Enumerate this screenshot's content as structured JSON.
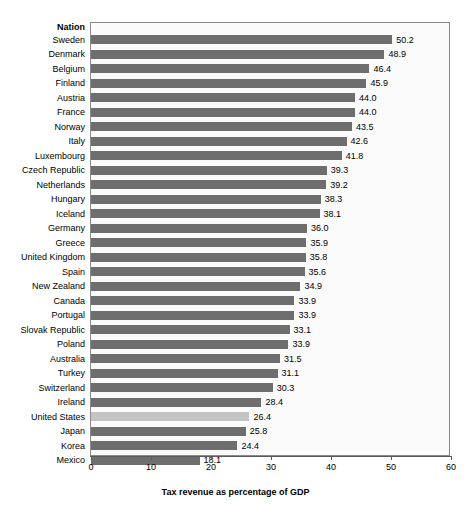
{
  "chart_data": {
    "type": "bar",
    "orientation": "horizontal",
    "title": "",
    "category_header": "Nation",
    "xlabel": "Tax revenue as percentage of GDP",
    "ylabel": "",
    "xlim": [
      0,
      60
    ],
    "xticks": [
      0,
      10,
      20,
      30,
      40,
      50,
      60
    ],
    "grid": false,
    "legend": null,
    "categories": [
      "Sweden",
      "Denmark",
      "Belgium",
      "Finland",
      "Austria",
      "France",
      "Norway",
      "Italy",
      "Luxembourg",
      "Czech Republic",
      "Netherlands",
      "Hungary",
      "Iceland",
      "Germany",
      "Greece",
      "United Kingdom",
      "Spain",
      "New Zealand",
      "Canada",
      "Portugal",
      "Slovak Republic",
      "Poland",
      "Australia",
      "Turkey",
      "Switzerland",
      "Ireland",
      "United States",
      "Japan",
      "Korea",
      "Mexico"
    ],
    "values": [
      50.2,
      48.9,
      46.4,
      45.9,
      44.0,
      44.0,
      43.5,
      42.6,
      41.8,
      39.3,
      39.2,
      38.3,
      38.1,
      36.0,
      35.9,
      35.8,
      35.6,
      34.9,
      33.9,
      33.9,
      33.1,
      33.9,
      31.5,
      31.1,
      30.3,
      28.4,
      26.4,
      25.8,
      24.4,
      18.1
    ],
    "value_labels": [
      "50.2",
      "48.9",
      "46.4",
      "45.9",
      "44.0",
      "44.0",
      "43.5",
      "42.6",
      "41.8",
      "39.3",
      "39.2",
      "38.3",
      "38.1",
      "36.0",
      "35.9",
      "35.8",
      "35.6",
      "34.9",
      "33.9",
      "33.9",
      "33.1",
      "33.9",
      "31.5",
      "31.1",
      "30.3",
      "28.4",
      "26.4",
      "25.8",
      "24.4",
      "18.1"
    ],
    "bar_pixel_values": [
      50.2,
      48.9,
      46.4,
      45.9,
      44.0,
      44.0,
      43.5,
      42.6,
      41.8,
      39.3,
      39.2,
      38.3,
      38.1,
      36.0,
      35.9,
      35.8,
      35.6,
      34.9,
      33.9,
      33.9,
      33.1,
      32.9,
      31.5,
      31.1,
      30.3,
      28.4,
      26.4,
      25.8,
      24.4,
      18.1
    ],
    "highlighted_category": "United States",
    "colors": {
      "bar": "#6e6e6e",
      "bar_highlight": "#c4c4c4",
      "plot_background": "#fbfbfb",
      "plot_border": "#8a8a8a",
      "axis": "#5a5a5a",
      "text": "#000000"
    }
  }
}
